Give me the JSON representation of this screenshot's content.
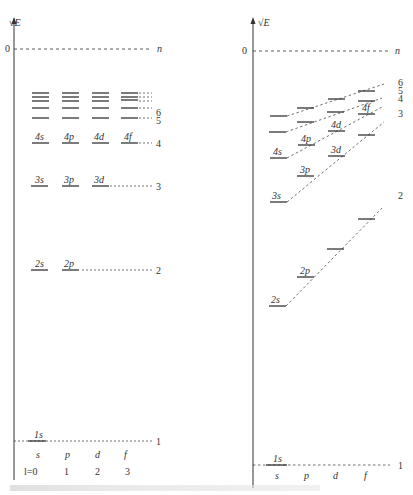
{
  "left_panel": {
    "axis_label": "√E",
    "zero_label": "0",
    "n_label": "n",
    "sublevels": [
      "4s",
      "4p",
      "4d",
      "4f",
      "3s",
      "3p",
      "3d",
      "2s",
      "2p",
      "1s"
    ],
    "n_levels": [
      "6",
      "5",
      "4",
      "3",
      "2",
      "1"
    ],
    "orbital_types": [
      "s",
      "p",
      "d",
      "f"
    ],
    "l_values": [
      "l=0",
      "1",
      "2",
      "3"
    ]
  },
  "right_panel": {
    "axis_label": "√E",
    "zero_label": "0",
    "n_label": "n",
    "sublevels": [
      "4s",
      "4p",
      "4d",
      "4f",
      "3s",
      "3p",
      "3d",
      "2s",
      "2p",
      "1s"
    ],
    "n_levels": [
      "6",
      "5",
      "4",
      "3",
      "2",
      "1"
    ],
    "orbital_types": [
      "s",
      "p",
      "d",
      "f"
    ]
  },
  "caption": ""
}
